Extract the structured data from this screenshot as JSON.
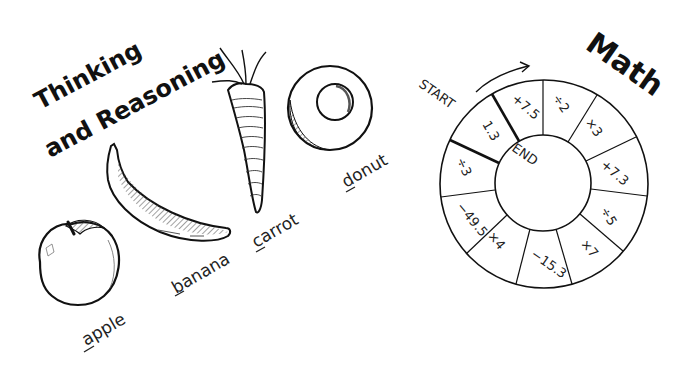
{
  "left_panel": {
    "title_line1": "Thinking",
    "title_line2": "and Reasoning",
    "items": [
      {
        "name": "apple",
        "label": "apple",
        "underlined_letter": "a"
      },
      {
        "name": "banana",
        "label": "banana",
        "underlined_letter": "b"
      },
      {
        "name": "carrot",
        "label": "carrot",
        "underlined_letter": "c"
      },
      {
        "name": "donut",
        "label": "donut",
        "underlined_letter": "d"
      }
    ]
  },
  "right_panel": {
    "title": "Math",
    "start_label": "START",
    "end_label": "END",
    "wheel_segments": [
      "1.3",
      "+7.5",
      "÷2",
      "×3",
      "+7.3",
      "÷5",
      "×7",
      "−15.3",
      "×4",
      "−49.5",
      "÷3"
    ]
  },
  "colors": {
    "ink": "#111111",
    "background": "#ffffff",
    "hatch": "#555555"
  }
}
